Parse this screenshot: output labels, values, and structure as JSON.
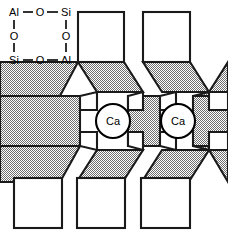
{
  "figure": {
    "background_color": "#ffffff",
    "line_color": "#000000",
    "shade_fill_color": "#a8a8a8",
    "white_fill_color": "#ffffff",
    "width": 228,
    "height": 240
  },
  "formula_inset": {
    "name": "aluminosilicate-ring-formula",
    "top_row": [
      {
        "label": "Al",
        "x": 14,
        "y": 12
      },
      {
        "label": "O",
        "x": 40,
        "y": 12
      },
      {
        "label": "Si",
        "x": 66,
        "y": 12
      }
    ],
    "middle_row": [
      {
        "label": "O",
        "x": 14,
        "y": 36
      },
      {
        "label": "O",
        "x": 66,
        "y": 36
      }
    ],
    "bottom_row": [
      {
        "label": "Si",
        "x": 14,
        "y": 60
      },
      {
        "label": "O",
        "x": 40,
        "y": 60
      },
      {
        "label": "Al",
        "x": 66,
        "y": 60
      }
    ],
    "horizontal_bonds": [
      {
        "x1": 22,
        "y1": 12,
        "x2": 33,
        "y2": 12
      },
      {
        "x1": 47,
        "y1": 12,
        "x2": 58,
        "y2": 12
      },
      {
        "x1": 22,
        "y1": 60,
        "x2": 33,
        "y2": 60
      },
      {
        "x1": 47,
        "y1": 60,
        "x2": 58,
        "y2": 60
      }
    ],
    "vertical_bonds": [
      {
        "x1": 14,
        "y1": 20,
        "x2": 14,
        "y2": 29
      },
      {
        "x1": 14,
        "y1": 43,
        "x2": 14,
        "y2": 52
      },
      {
        "x1": 66,
        "y1": 20,
        "x2": 66,
        "y2": 29
      },
      {
        "x1": 66,
        "y1": 43,
        "x2": 66,
        "y2": 52
      }
    ]
  },
  "cations": [
    {
      "label": "Ca",
      "cx": 113,
      "cy": 121,
      "r": 17
    },
    {
      "label": "Ca",
      "cx": 178,
      "cy": 121,
      "r": 17
    }
  ],
  "white_squares": [
    {
      "name": "top-square-1",
      "x": 78,
      "y": 12,
      "w": 46,
      "h": 50
    },
    {
      "name": "top-square-2",
      "x": 143,
      "y": 12,
      "w": 47,
      "h": 50
    },
    {
      "name": "bottom-square-1",
      "x": 14,
      "y": 178,
      "w": 48,
      "h": 50
    },
    {
      "name": "bottom-square-2",
      "x": 77,
      "y": 178,
      "w": 48,
      "h": 50
    },
    {
      "name": "bottom-square-3",
      "x": 141,
      "y": 178,
      "w": 49,
      "h": 50
    }
  ],
  "shaded_polygons": [
    {
      "name": "band-left-upper-trapezoid",
      "points": "0,62 45,62 78,62 60,96 0,96"
    },
    {
      "name": "band-left-rect",
      "points": "0,96 80,96 80,146 0,146"
    },
    {
      "name": "band-left-lower-trapezoid",
      "points": "0,146 80,146 60,182 0,182"
    },
    {
      "name": "cavity-1-upper-wedge",
      "points": "78,62 124,62 143,92 97,92"
    },
    {
      "name": "cavity-1-lower-wedge",
      "points": "97,150 143,150 124,180 78,180"
    },
    {
      "name": "band-mid-rect",
      "points": "128,96 160,96 160,146 128,146"
    },
    {
      "name": "cavity-2-upper-wedge",
      "points": "143,62 190,62 209,92 162,92"
    },
    {
      "name": "cavity-2-lower-wedge",
      "points": "162,150 209,150 190,180 143,180"
    },
    {
      "name": "band-right-rect",
      "points": "193,96 228,96 228,146 193,146"
    },
    {
      "name": "band-right-upper-trapezoid",
      "points": "209,62 228,62 228,96 193,96"
    },
    {
      "name": "band-right-lower-trapezoid",
      "points": "193,146 228,146 228,182 209,182"
    }
  ],
  "white_wedges": [
    {
      "name": "cavity-1-left-notch",
      "points": "80,96 97,92 97,110 80,110"
    },
    {
      "name": "cavity-1-right-notch",
      "points": "128,96 143,92 143,110 128,110"
    },
    {
      "name": "cavity-2-left-notch",
      "points": "160,96 176,92 176,110 160,110"
    },
    {
      "name": "cavity-2-right-notch",
      "points": "209,92 228,92 228,110 209,110"
    }
  ]
}
